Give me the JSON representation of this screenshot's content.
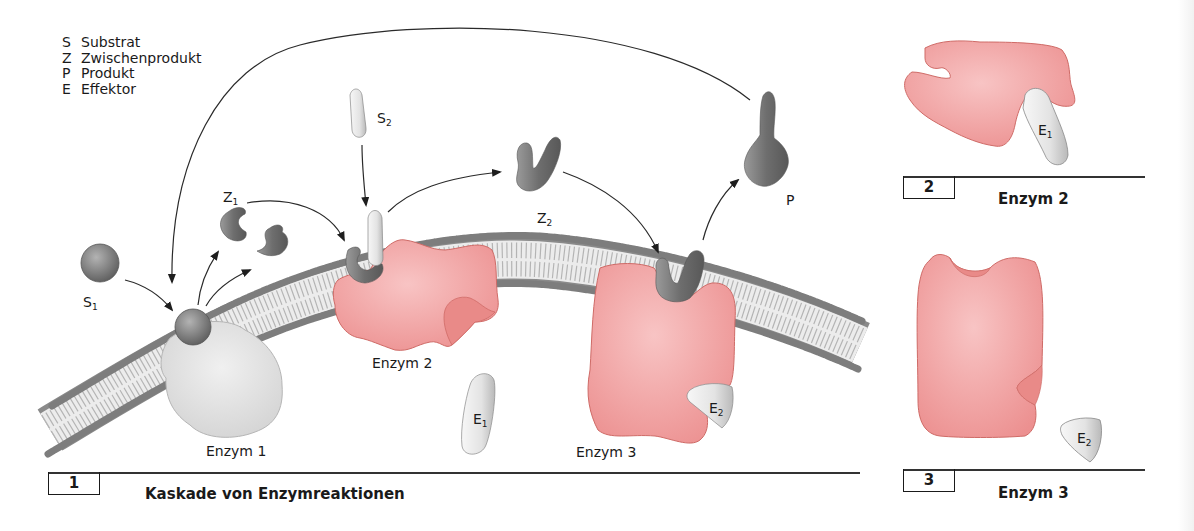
{
  "legend": {
    "items": [
      {
        "key": "S",
        "label": "Substrat"
      },
      {
        "key": "Z",
        "label": "Zwischenprodukt"
      },
      {
        "key": "P",
        "label": "Produkt"
      },
      {
        "key": "E",
        "label": "Effektor"
      }
    ]
  },
  "molecules": {
    "s1": {
      "letter": "S",
      "sub": "1"
    },
    "s2": {
      "letter": "S",
      "sub": "2"
    },
    "z1": {
      "letter": "Z",
      "sub": "1"
    },
    "z2": {
      "letter": "Z",
      "sub": "2"
    },
    "p": {
      "letter": "P"
    },
    "e1": {
      "letter": "E",
      "sub": "1"
    },
    "e2": {
      "letter": "E",
      "sub": "2"
    }
  },
  "enzymes": {
    "enzym1": "Enzym 1",
    "enzym2": "Enzym 2",
    "enzym3": "Enzym 3"
  },
  "panels": [
    {
      "number": "1",
      "title": "Kaskade von Enzymreaktionen"
    },
    {
      "number": "2",
      "title": "Enzym 2"
    },
    {
      "number": "3",
      "title": "Enzym 3"
    }
  ],
  "colors": {
    "enzyme_pink": "#f2a6a6",
    "enzyme_pink_stroke": "#c9524e",
    "enzyme1_gray": "#e2e2e2",
    "molecule_dark": "#7a7a7a",
    "molecule_light": "#e8e8e8",
    "membrane_head": "#8a8a8a",
    "membrane_body": "#e9e9e9",
    "arrow": "#222222"
  }
}
